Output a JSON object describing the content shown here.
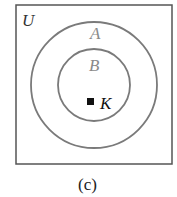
{
  "diagram": {
    "type": "venn",
    "universe_label": "U",
    "sets": [
      {
        "label": "A",
        "relation": "outer circle, contains B"
      },
      {
        "label": "B",
        "relation": "inner circle, subset of A"
      }
    ],
    "element": {
      "label": "K",
      "marker": "square",
      "location": "inside B"
    },
    "caption": "(c)",
    "colors": {
      "frame": "#555555",
      "circles": "#7a7a7a",
      "set_labels": "#8a8a8a",
      "element": "#111111"
    }
  }
}
